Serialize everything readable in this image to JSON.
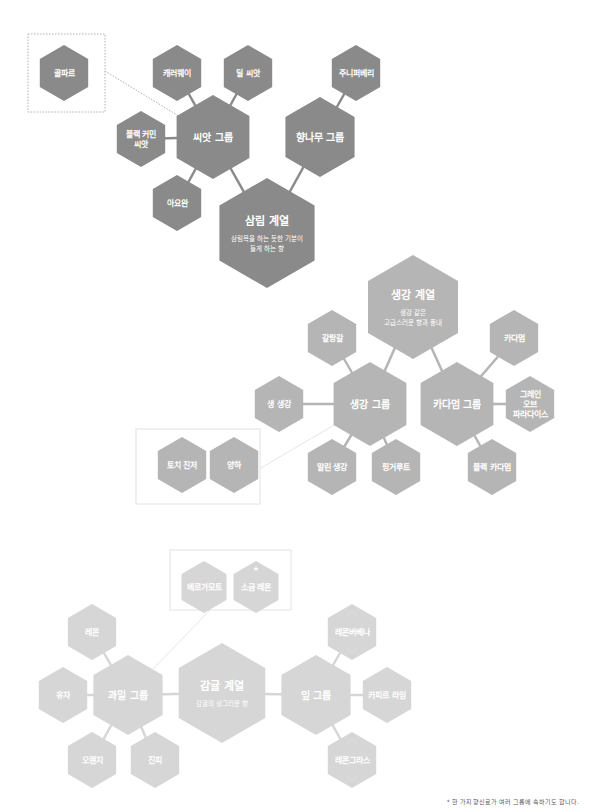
{
  "diagram": {
    "sections": [
      {
        "id": "forest",
        "color": "#8a8a8a",
        "line_color": "#8a8a8a",
        "family": {
          "label": "삼림 계열",
          "desc": [
            "삼림욕을 하는 듯한 기분이",
            "들게 하는 향"
          ],
          "cx": 267,
          "cy": 233,
          "r": 55
        },
        "groups": [
          {
            "label": "씨앗 그룹",
            "cx": 213,
            "cy": 137,
            "r": 42
          },
          {
            "label": "향나무 그룹",
            "cx": 320,
            "cy": 137,
            "r": 40
          }
        ],
        "items": [
          {
            "label": "캐러웨이",
            "cx": 177,
            "cy": 73,
            "r": 28,
            "group": 0
          },
          {
            "label": "딜 씨앗",
            "cx": 248,
            "cy": 73,
            "r": 28,
            "group": 0
          },
          {
            "label": "블랙 커민 씨앗",
            "lines": [
              "블랙 커민",
              "씨앗"
            ],
            "cx": 141,
            "cy": 139,
            "r": 28,
            "group": 0
          },
          {
            "label": "아요완",
            "cx": 177,
            "cy": 203,
            "r": 28,
            "group": 0
          },
          {
            "label": "주니퍼베리",
            "cx": 356,
            "cy": 73,
            "r": 28,
            "group": 1
          }
        ],
        "related_box": {
          "x": 28,
          "y": 34,
          "w": 77,
          "h": 78,
          "items": [
            {
              "label": "골파르",
              "cx": 64,
              "cy": 73,
              "r": 28
            }
          ],
          "link_to_group": 0
        }
      },
      {
        "id": "ginger",
        "color": "#b5b5b5",
        "line_color": "#b5b5b5",
        "family": {
          "label": "생강 계열",
          "desc": [
            "생강 같은",
            "고급스러운 향과 풍내"
          ],
          "cx": 413,
          "cy": 307,
          "r": 52
        },
        "groups": [
          {
            "label": "생강 그룹",
            "cx": 370,
            "cy": 404,
            "r": 42
          },
          {
            "label": "카다멈 그룹",
            "cx": 457,
            "cy": 404,
            "r": 42
          }
        ],
        "items": [
          {
            "label": "갈랑갈",
            "cx": 332,
            "cy": 338,
            "r": 28,
            "group": 0
          },
          {
            "label": "생 생강",
            "cx": 279,
            "cy": 404,
            "r": 28,
            "group": 0
          },
          {
            "label": "말린 생강",
            "cx": 332,
            "cy": 467,
            "r": 28,
            "group": 0
          },
          {
            "label": "핑거루트",
            "cx": 396,
            "cy": 467,
            "r": 28,
            "group": 0
          },
          {
            "label": "카다멈",
            "cx": 514,
            "cy": 338,
            "r": 28,
            "group": 1
          },
          {
            "label": "그레인 오브 파라다이스",
            "lines": [
              "그레인",
              "오브",
              "파라다이스"
            ],
            "cx": 530,
            "cy": 404,
            "r": 28,
            "group": 1
          },
          {
            "label": "블랙 카다멈",
            "cx": 492,
            "cy": 467,
            "r": 28,
            "group": 1
          }
        ],
        "related_box": {
          "x": 136,
          "y": 429,
          "w": 124,
          "h": 75,
          "items": [
            {
              "label": "토치 진저",
              "cx": 182,
              "cy": 465,
              "r": 28
            },
            {
              "label": "양하",
              "cx": 234,
              "cy": 465,
              "r": 28
            }
          ],
          "link_to_group": 0
        }
      },
      {
        "id": "citrus",
        "color": "#d6d6d6",
        "line_color": "#d6d6d6",
        "family": {
          "label": "감귤 계열",
          "desc": [
            "감귤의 상그러운 향"
          ],
          "cx": 222,
          "cy": 693,
          "r": 50
        },
        "groups": [
          {
            "label": "과일 그룹",
            "cx": 128,
            "cy": 695,
            "r": 40
          },
          {
            "label": "잎 그룹",
            "cx": 316,
            "cy": 695,
            "r": 40
          }
        ],
        "items": [
          {
            "label": "레몬",
            "cx": 92,
            "cy": 632,
            "r": 28,
            "group": 0
          },
          {
            "label": "유자",
            "cx": 63,
            "cy": 695,
            "r": 28,
            "group": 0
          },
          {
            "label": "오렌지",
            "cx": 92,
            "cy": 760,
            "r": 28,
            "group": 0
          },
          {
            "label": "진피",
            "cx": 155,
            "cy": 760,
            "r": 28,
            "group": 0
          },
          {
            "label": "레몬버베나",
            "cx": 352,
            "cy": 632,
            "r": 28,
            "group": 1
          },
          {
            "label": "카피르 라임",
            "cx": 387,
            "cy": 695,
            "r": 28,
            "group": 1
          },
          {
            "label": "레몬그라스",
            "cx": 352,
            "cy": 760,
            "r": 28,
            "group": 1
          }
        ],
        "related_box": {
          "x": 170,
          "y": 550,
          "w": 121,
          "h": 60,
          "items": [
            {
              "label": "베르가모트",
              "cx": 204,
              "cy": 587,
              "r": 26
            },
            {
              "label": "소금 레몬",
              "cx": 256,
              "cy": 587,
              "r": 26,
              "star": "★"
            }
          ],
          "link_to_group": 0
        }
      }
    ],
    "caption": "* 한 가지 향신료가 여러 그룹에 속하기도 합니다."
  }
}
